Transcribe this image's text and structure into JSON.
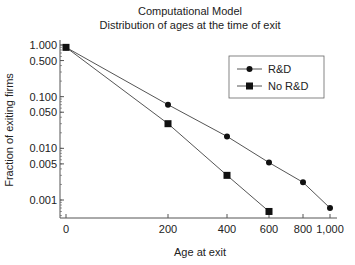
{
  "chart_data": {
    "type": "line",
    "title": "Computational Model",
    "subtitle": "Distribution of ages at the time of exit",
    "xlabel": "Age at exit",
    "ylabel": "Fraction of exiting firms",
    "xscale": "nonlinear (compressed, approx. square-root)",
    "yscale": "log",
    "x_ticks": [
      {
        "value": 0,
        "label": "0"
      },
      {
        "value": 200,
        "label": "200"
      },
      {
        "value": 400,
        "label": "400"
      },
      {
        "value": 600,
        "label": "600"
      },
      {
        "value": 800,
        "label": "800"
      },
      {
        "value": 1000,
        "label": "1,000"
      }
    ],
    "y_ticks": [
      {
        "value": 1.0,
        "label": "1.000"
      },
      {
        "value": 0.5,
        "label": "0.500"
      },
      {
        "value": 0.1,
        "label": "0.100"
      },
      {
        "value": 0.05,
        "label": "0.050"
      },
      {
        "value": 0.01,
        "label": "0.010"
      },
      {
        "value": 0.005,
        "label": "0.005"
      },
      {
        "value": 0.001,
        "label": "0.001"
      }
    ],
    "ylim": [
      0.0005,
      1.0
    ],
    "xlim": [
      0,
      1000
    ],
    "grid": false,
    "legend_position": "upper right",
    "series": [
      {
        "name": "R&D",
        "marker": "circle",
        "x": [
          0,
          200,
          400,
          600,
          800,
          1000
        ],
        "values": [
          0.9,
          0.07,
          0.017,
          0.0053,
          0.0022,
          0.0007
        ]
      },
      {
        "name": "No R&D",
        "marker": "square",
        "x": [
          0,
          200,
          400,
          600
        ],
        "values": [
          0.9,
          0.03,
          0.003,
          0.0006
        ]
      }
    ]
  },
  "colors": {
    "line": "#555555",
    "marker": "#111111",
    "axis": "#555555",
    "text": "#222222"
  }
}
